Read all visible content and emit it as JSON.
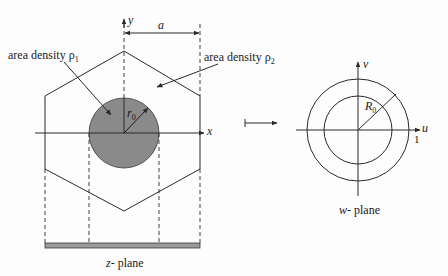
{
  "figure": {
    "z_plane": {
      "caption_var": "z",
      "caption_text": "- plane",
      "x_axis_label": "x",
      "y_axis_label": "y",
      "dimension_label": "a",
      "radius_label_main": "r",
      "radius_label_sub": "0",
      "region1": {
        "label": "area density ρ",
        "sub": "1"
      },
      "region2": {
        "label": "area density ρ",
        "sub": "2"
      },
      "disk_color": "#8a8a8a",
      "bar_color": "#9a9a9a"
    },
    "mapping_arrow": "maps-to",
    "w_plane": {
      "caption_var": "w",
      "caption_text": "- plane",
      "u_axis_label": "u",
      "v_axis_label": "v",
      "radius_label_main": "R",
      "radius_label_sub": "0",
      "unit_tick_label": "1"
    },
    "line_color": "#2a2a2a"
  }
}
